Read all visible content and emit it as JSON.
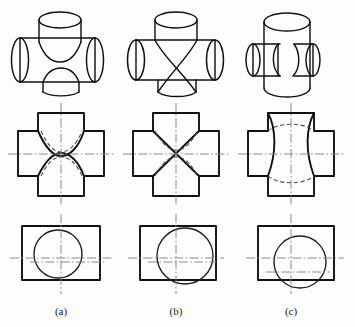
{
  "figure": {
    "columns": [
      {
        "id": "a",
        "caption": "(a)",
        "note": "vertical cylinder smaller in diameter than horizontal cylinder; curves of intersection bend toward the axis of the larger cylinder"
      },
      {
        "id": "b",
        "caption": "(b)",
        "note": "both cylinders of equal diameter; curves of intersection project as straight lines forming an X"
      },
      {
        "id": "c",
        "caption": "(c)",
        "note": "vertical cylinder larger in diameter than horizontal cylinder; curves of intersection bend toward the axis of the smaller cylinder"
      }
    ],
    "rows": [
      {
        "id": "pictorial",
        "label": "isometric pictorial"
      },
      {
        "id": "front",
        "label": "front view"
      },
      {
        "id": "top",
        "label": "top view"
      }
    ],
    "line_types": [
      {
        "name": "visible-outline",
        "color": "#111111",
        "style": "continuous thick"
      },
      {
        "name": "hidden-line",
        "color": "#4a4a4a",
        "style": "dashed"
      },
      {
        "name": "center-line",
        "color": "#8a8a8a",
        "style": "dash-dot"
      }
    ]
  },
  "colors": {
    "paper": "#fdfdfc",
    "outline": "#111111",
    "hidden": "#4a4a4a",
    "center": "#8a8a8a",
    "caption": "#1a1a1a"
  }
}
